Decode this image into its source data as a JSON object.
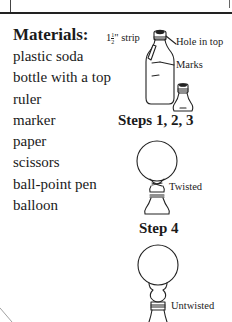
{
  "materials": {
    "heading": "Materials:",
    "items": [
      "plastic soda",
      "bottle with a top",
      "ruler",
      "marker",
      "paper",
      "scissors",
      "ball-point pen",
      "balloon"
    ]
  },
  "figures": {
    "strip_label_whole": "1",
    "strip_label_num": "1",
    "strip_label_den": "2",
    "strip_label_suffix": "\" strip",
    "hole_label": "Hole in top",
    "marks_label": "Marks",
    "steps_123_heading": "Steps 1, 2, 3",
    "twisted_label": "Twisted",
    "step4_heading": "Step 4",
    "untwisted_label": "Untwisted"
  }
}
